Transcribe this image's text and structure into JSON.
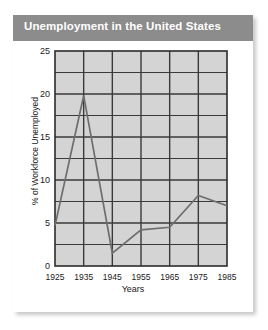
{
  "figure": {
    "title": "Unemployment in the United States",
    "title_bg_color": "#8c8c8c",
    "title_text_color": "#ffffff",
    "card_bg_color": "#ffffff"
  },
  "chart_data": {
    "type": "line",
    "title": "Unemployment in the United States",
    "xlabel": "Years",
    "ylabel": "% of Workforce Unemployed",
    "categories": [
      "1925",
      "1935",
      "1945",
      "1955",
      "1965",
      "1975",
      "1985"
    ],
    "x": [
      1925,
      1935,
      1945,
      1955,
      1965,
      1975,
      1985
    ],
    "values": [
      4.7,
      19.8,
      1.5,
      4.2,
      4.5,
      8.2,
      7.0
    ],
    "series": [
      {
        "name": "% of Workforce Unemployed",
        "values": [
          4.7,
          19.8,
          1.5,
          4.2,
          4.5,
          8.2,
          7.0
        ]
      }
    ],
    "xlim": [
      1925,
      1985
    ],
    "ylim": [
      0,
      25
    ],
    "ytick_labels": [
      "0",
      "5",
      "10",
      "15",
      "20",
      "25"
    ],
    "yticks": [
      0,
      5,
      10,
      15,
      20,
      25
    ],
    "xtick_labels": [
      "1925",
      "1935",
      "1945",
      "1955",
      "1965",
      "1975",
      "1985"
    ],
    "grid": true,
    "grid_y_step": 2.5,
    "grid_x_step": 10,
    "legend": "none",
    "plot_bg_color": "#d4d4d4",
    "grid_color": "#3a3a3a",
    "line_color": "#6e6e6e",
    "axis_color": "#2b2b2b"
  }
}
